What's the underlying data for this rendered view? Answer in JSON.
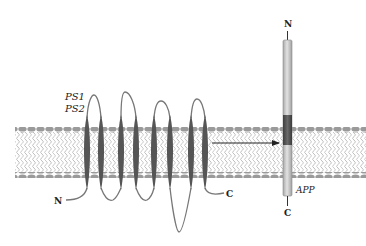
{
  "diagram": {
    "title": "",
    "colors": {
      "background": "#ffffff",
      "membrane_head": "#9a9a9a",
      "membrane_tail": "#bdbdbd",
      "helix": "#555555",
      "loop": "#777777",
      "app_rod_light": "#cfcfcf",
      "app_rod_dark": "#5a5a5a",
      "arrow": "#222222",
      "text": "#222222"
    },
    "labels": {
      "ps1": "PS1",
      "ps2": "PS2",
      "presenilin_n": "N",
      "presenilin_c": "C",
      "app": "APP",
      "app_n": "N",
      "app_c": "C"
    },
    "presenilin": {
      "helix_count": 8,
      "helix_centers_x": [
        87,
        101,
        121,
        136,
        154,
        170,
        191,
        205
      ]
    },
    "arrow": {
      "from": "presenilin",
      "to": "APP transmembrane domain"
    }
  }
}
